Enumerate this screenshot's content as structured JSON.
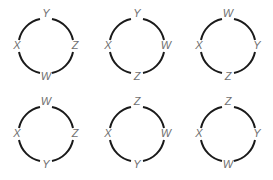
{
  "diagrams": [
    {
      "top": "Y",
      "left": "X",
      "right": "Z",
      "bottom": "W"
    },
    {
      "top": "Y",
      "left": "X",
      "right": "W",
      "bottom": "Z"
    },
    {
      "top": "W",
      "left": "X",
      "right": "Y",
      "bottom": "Z"
    },
    {
      "top": "W",
      "left": "X",
      "right": "Z",
      "bottom": "Y"
    },
    {
      "top": "Z",
      "left": "X",
      "right": "W",
      "bottom": "Y"
    },
    {
      "top": "Z",
      "left": "X",
      "right": "Y",
      "bottom": "W"
    }
  ],
  "colors": {
    "arc": "#1a1a1a",
    "label": "#6f6f6f",
    "background": "#ffffff"
  }
}
